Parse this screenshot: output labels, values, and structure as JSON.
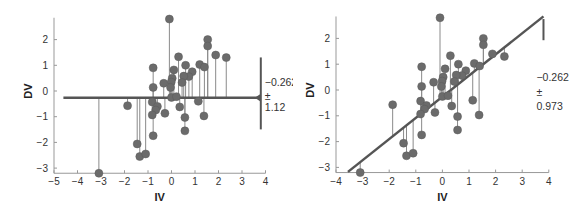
{
  "chart_data": [
    {
      "type": "scatter",
      "panel": "left",
      "title": "",
      "xlabel": "IV",
      "ylabel": "DV",
      "xlim": [
        -5,
        4
      ],
      "ylim": [
        -3.2,
        2.85
      ],
      "xticks": [
        -5,
        -4,
        -3,
        -2,
        -1,
        0,
        1,
        2,
        3,
        4
      ],
      "yticks": [
        -3,
        -2,
        -1,
        0,
        1,
        2
      ],
      "xtick_labels": [
        "−5",
        "−4",
        "−3",
        "−2",
        "−1",
        "0",
        "1",
        "2",
        "3",
        "4"
      ],
      "ytick_labels": [
        "−3",
        "−2",
        "−1",
        "0",
        "1",
        "2"
      ],
      "grid": false,
      "model": {
        "kind": "horizontal-mean",
        "intercept": -0.262,
        "slope": 0,
        "x_start": -4.6,
        "x_end": 3.8
      },
      "residual_sd_bar": {
        "center": -0.262,
        "half_width": 1.12,
        "x": 3.8
      },
      "annotation": {
        "value": "−0.262",
        "pm": "±",
        "sd": "1.12"
      },
      "points": [
        [
          -0.09,
          2.8
        ],
        [
          1.54,
          2.0
        ],
        [
          1.54,
          1.75
        ],
        [
          1.88,
          1.4
        ],
        [
          2.33,
          1.3
        ],
        [
          0.3,
          1.33
        ],
        [
          1.2,
          1.03
        ],
        [
          1.4,
          0.93
        ],
        [
          0.6,
          1.0
        ],
        [
          -0.78,
          0.9
        ],
        [
          0.1,
          0.82
        ],
        [
          0.88,
          0.75
        ],
        [
          0.74,
          0.56
        ],
        [
          0.52,
          0.58
        ],
        [
          0.03,
          0.5
        ],
        [
          -0.01,
          0.35
        ],
        [
          0.45,
          0.33
        ],
        [
          -0.33,
          0.3
        ],
        [
          -0.78,
          0.14
        ],
        [
          -0.04,
          0.14
        ],
        [
          0.0,
          -0.25
        ],
        [
          0.21,
          -0.22
        ],
        [
          -1.87,
          -0.57
        ],
        [
          -0.82,
          -0.43
        ],
        [
          -0.6,
          -0.6
        ],
        [
          -0.67,
          -0.74
        ],
        [
          0.35,
          -0.62
        ],
        [
          1.14,
          -0.4
        ],
        [
          -0.82,
          -0.93
        ],
        [
          -0.28,
          -0.87
        ],
        [
          0.57,
          -1.03
        ],
        [
          1.38,
          -0.97
        ],
        [
          0.57,
          -1.55
        ],
        [
          -0.78,
          -1.74
        ],
        [
          -1.46,
          -2.06
        ],
        [
          -1.35,
          -2.55
        ],
        [
          -1.1,
          -2.45
        ],
        [
          -3.09,
          -3.2
        ]
      ]
    },
    {
      "type": "scatter",
      "panel": "right",
      "title": "",
      "xlabel": "IV",
      "ylabel": "DV",
      "xlim": [
        -4,
        4
      ],
      "ylim": [
        -3.2,
        2.85
      ],
      "xticks": [
        -4,
        -3,
        -2,
        -1,
        0,
        1,
        2,
        3,
        4
      ],
      "yticks": [
        -3,
        -2,
        -1,
        0,
        1,
        2
      ],
      "xtick_labels": [
        "−4",
        "−3",
        "−2",
        "−1",
        "0",
        "1",
        "2",
        "3",
        "4"
      ],
      "ytick_labels": [
        "−3",
        "−2",
        "−1",
        "0",
        "1",
        "2"
      ],
      "grid": false,
      "model": {
        "kind": "regression-line",
        "intercept": -0.262,
        "slope": 0.82,
        "x_start": -3.55,
        "x_end": 3.8
      },
      "residual_sd_bar": {
        "half_width": 0.973,
        "x": 3.8,
        "top": 2.75,
        "bottom": 1.93
      },
      "annotation": {
        "value": "−0.262",
        "pm": "±",
        "sd": "0.973"
      },
      "points": "same as left panel"
    }
  ],
  "colors": {
    "point": "#6b6b6b",
    "point_edge": "#5a5a5a",
    "residual_line": "#8a8a8a",
    "model_line": "#555555",
    "axis": "#999999",
    "text": "#333333"
  }
}
